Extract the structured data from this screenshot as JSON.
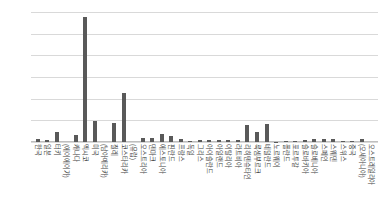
{
  "chart_data": {
    "type": "bar",
    "title": "",
    "subtitle": "",
    "xlabel": "",
    "ylabel": "",
    "ylim": [
      0,
      30
    ],
    "ytick_labels": [
      "30.0",
      "25.0",
      "20.0",
      "15.0",
      "10.0",
      "5.0",
      "0.0"
    ],
    "ytick_values": [
      30,
      25,
      20,
      15,
      10,
      5,
      0
    ],
    "grid": true,
    "legend": "none",
    "orientation": "vertical",
    "bar_color": "#595959",
    "grid_color": "#D9D9D9",
    "categories": [
      "한국",
      "일본",
      "터키",
      "(에이에이가)",
      "캐나다",
      "멕시코",
      "미국",
      "(남아메리카)",
      "칠레",
      "코스타리카",
      "(유럽)",
      "오스트리아",
      "덴마크",
      "에스토니아",
      "핀란드",
      "프랑스",
      "독일",
      "그리스",
      "아이슬란드",
      "아일랜드",
      "이탈리아",
      "라트비아",
      "리히텐슈타인",
      "룩셈부르크",
      "네덜란드",
      "노르웨이",
      "폴란드",
      "포르투갈",
      "슬로바키아",
      "슬로베니아",
      "스페인",
      "스웨덴",
      "스위스",
      "중국",
      "(오세아니아)",
      "오스트레일리아"
    ],
    "values": [
      0.7,
      0.4,
      2.4,
      0.0,
      1.6,
      28.8,
      4.9,
      0.0,
      4.3,
      11.2,
      0.0,
      0.9,
      0.9,
      1.9,
      1.4,
      0.7,
      0.2,
      0.5,
      0.5,
      0.5,
      0.5,
      0.4,
      4.0,
      2.3,
      4.1,
      0.1,
      0.3,
      0.3,
      0.5,
      0.6,
      0.6,
      0.8,
      0.2,
      0.3,
      0.6,
      0.0
    ]
  }
}
